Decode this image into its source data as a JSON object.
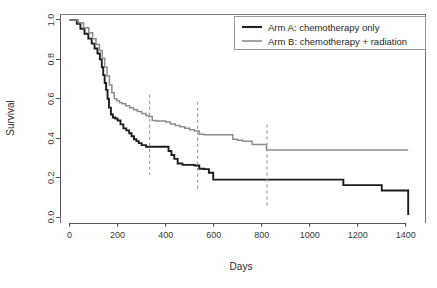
{
  "chart_data": {
    "type": "line",
    "title": "",
    "subtitle": "",
    "xlabel": "Days",
    "ylabel": "Survival",
    "xlim": [
      -40,
      1480
    ],
    "ylim": [
      -0.03,
      1.03
    ],
    "xticks": [
      0,
      200,
      400,
      600,
      800,
      1000,
      1200,
      1400
    ],
    "xtick_labels": [
      "0",
      "200",
      "400",
      "600",
      "800",
      "1000",
      "1200",
      "1400"
    ],
    "yticks": [
      0.0,
      0.2,
      0.4,
      0.6,
      0.8,
      1.0
    ],
    "ytick_labels": [
      "0.0",
      "0.2",
      "0.4",
      "0.6",
      "0.8",
      "1.0"
    ],
    "grid": false,
    "legend_position": "top-right",
    "plot_style": "step-post",
    "series": [
      {
        "name": "Arm A: chemotherapy only",
        "color": "#1d1d1d",
        "linewidth": 1.9,
        "x": [
          0,
          30,
          45,
          62,
          78,
          92,
          104,
          116,
          126,
          134,
          140,
          146,
          152,
          158,
          164,
          172,
          180,
          190,
          200,
          212,
          224,
          236,
          248,
          258,
          268,
          278,
          288,
          300,
          318,
          340,
          360,
          380,
          400,
          412,
          424,
          436,
          450,
          470,
          500,
          520,
          540,
          560,
          580,
          598,
          700,
          900,
          1100,
          1140,
          1300,
          1410,
          1410
        ],
        "y": [
          1.0,
          0.98,
          0.955,
          0.93,
          0.905,
          0.88,
          0.855,
          0.83,
          0.8,
          0.76,
          0.72,
          0.68,
          0.645,
          0.6,
          0.555,
          0.52,
          0.505,
          0.5,
          0.49,
          0.47,
          0.45,
          0.44,
          0.425,
          0.41,
          0.395,
          0.385,
          0.375,
          0.365,
          0.357,
          0.357,
          0.357,
          0.357,
          0.357,
          0.335,
          0.315,
          0.295,
          0.272,
          0.265,
          0.265,
          0.262,
          0.245,
          0.243,
          0.225,
          0.19,
          0.19,
          0.19,
          0.19,
          0.162,
          0.135,
          0.135,
          0.01
        ]
      },
      {
        "name": "Arm B: chemotherapy + radiation",
        "color": "#8c8c8c",
        "linewidth": 1.5,
        "x": [
          0,
          36,
          58,
          80,
          96,
          110,
          124,
          136,
          146,
          156,
          166,
          176,
          186,
          196,
          208,
          220,
          234,
          250,
          266,
          282,
          300,
          318,
          330,
          344,
          360,
          380,
          400,
          420,
          440,
          460,
          480,
          500,
          520,
          540,
          560,
          580,
          600,
          625,
          650,
          680,
          700,
          720,
          760,
          800,
          820,
          1000,
          1200,
          1410
        ],
        "y": [
          1.0,
          0.985,
          0.96,
          0.935,
          0.905,
          0.875,
          0.845,
          0.805,
          0.76,
          0.715,
          0.67,
          0.63,
          0.6,
          0.59,
          0.58,
          0.575,
          0.565,
          0.555,
          0.545,
          0.535,
          0.525,
          0.515,
          0.51,
          0.49,
          0.487,
          0.487,
          0.482,
          0.472,
          0.465,
          0.458,
          0.45,
          0.443,
          0.437,
          0.42,
          0.418,
          0.418,
          0.418,
          0.418,
          0.418,
          0.395,
          0.39,
          0.385,
          0.368,
          0.368,
          0.34,
          0.34,
          0.34,
          0.34
        ]
      }
    ],
    "annotations": [
      {
        "name": "cutpoint-1",
        "type": "vline",
        "x": 333,
        "y_top": 0.62,
        "y_bottom": 0.215,
        "style": "dashed",
        "color": "#9a9a9a"
      },
      {
        "name": "cutpoint-2",
        "type": "vline",
        "x": 533,
        "y_top": 0.585,
        "y_bottom": 0.135,
        "style": "dashed",
        "color": "#9a9a9a"
      },
      {
        "name": "cutpoint-3",
        "type": "vline",
        "x": 822,
        "y_top": 0.47,
        "y_bottom": 0.055,
        "style": "dashed",
        "color": "#9a9a9a"
      }
    ]
  },
  "legend": {
    "entries": [
      {
        "label": "Arm A: chemotherapy only",
        "color": "#1d1d1d"
      },
      {
        "label": "Arm B: chemotherapy + radiation",
        "color": "#8c8c8c"
      }
    ]
  },
  "axes": {
    "x_title": "Days",
    "y_title": "Survival"
  }
}
